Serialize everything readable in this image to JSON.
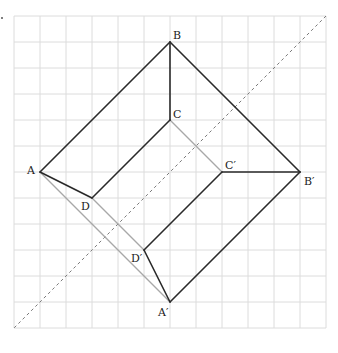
{
  "figure": {
    "type": "geometry-diagram",
    "grid": {
      "origin_x": 14,
      "origin_y": 16,
      "cell": 26,
      "cols": 12,
      "rows": 12,
      "color": "#dcdcdc"
    },
    "colors": {
      "visible_edge": "#2a2a2a",
      "hidden_edge": "#a8a8a8",
      "axis": "#7a7a7a"
    },
    "points": {
      "A": {
        "label": "A",
        "x": 40,
        "y": 172
      },
      "B": {
        "label": "B",
        "x": 170,
        "y": 42
      },
      "B_prime": {
        "label": "B′",
        "x": 300,
        "y": 172
      },
      "A_prime": {
        "label": "A′",
        "x": 170,
        "y": 302
      },
      "C": {
        "label": "C",
        "x": 170,
        "y": 120
      },
      "C_prime": {
        "label": "C′",
        "x": 222,
        "y": 172
      },
      "D": {
        "label": "D",
        "x": 92,
        "y": 198
      },
      "D_prime": {
        "label": "D′",
        "x": 144,
        "y": 250
      }
    },
    "visible_edges": [
      [
        "A",
        "B"
      ],
      [
        "B",
        "B_prime"
      ],
      [
        "B_prime",
        "A_prime"
      ],
      [
        "B",
        "C"
      ],
      [
        "A",
        "D"
      ],
      [
        "D",
        "C"
      ],
      [
        "B_prime",
        "C_prime"
      ],
      [
        "C_prime",
        "D_prime"
      ],
      [
        "A_prime",
        "D_prime"
      ]
    ],
    "hidden_edges": [
      [
        "A",
        "A_prime"
      ],
      [
        "D",
        "D_prime"
      ],
      [
        "C",
        "C_prime"
      ]
    ],
    "axis_line": {
      "x1": 326,
      "y1": 16,
      "x2": 14,
      "y2": 328,
      "style": "dashed"
    }
  }
}
